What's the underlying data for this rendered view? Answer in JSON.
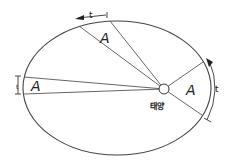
{
  "diagram": {
    "sun_label": "태양",
    "area_labels": [
      "A",
      "A",
      "A"
    ],
    "time_labels": [
      "t",
      "t",
      "t"
    ],
    "colors": {
      "stroke": "#333333",
      "background": "#ffffff"
    }
  }
}
